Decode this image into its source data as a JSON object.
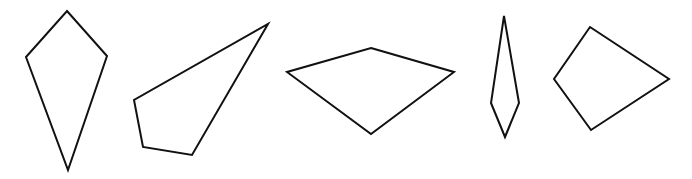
{
  "diagram": {
    "width": 692,
    "height": 179,
    "background": "#ffffff",
    "stroke_color": "#111111",
    "stroke_width": 2,
    "shapes": [
      {
        "name": "kite-vertical",
        "type": "quadrilateral",
        "points": [
          [
            67,
            11
          ],
          [
            107,
            56
          ],
          [
            68,
            170
          ],
          [
            26,
            57
          ]
        ]
      },
      {
        "name": "irregular-quadrilateral",
        "type": "quadrilateral",
        "points": [
          [
            268,
            24
          ],
          [
            192,
            155
          ],
          [
            143,
            147
          ],
          [
            134,
            100
          ]
        ]
      },
      {
        "name": "kite-horizontal",
        "type": "quadrilateral",
        "points": [
          [
            371,
            48
          ],
          [
            454,
            72
          ],
          [
            371,
            134
          ],
          [
            287,
            72
          ]
        ]
      },
      {
        "name": "narrow-kite",
        "type": "quadrilateral",
        "points": [
          [
            504,
            16
          ],
          [
            519,
            103
          ],
          [
            505,
            137
          ],
          [
            491,
            103
          ]
        ]
      },
      {
        "name": "kite-right",
        "type": "quadrilateral",
        "points": [
          [
            590,
            27
          ],
          [
            669,
            79
          ],
          [
            591,
            130
          ],
          [
            554,
            79
          ]
        ]
      }
    ]
  }
}
